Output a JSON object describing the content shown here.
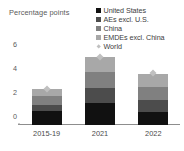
{
  "chart_data": {
    "type": "bar",
    "title": "",
    "subtitle": "",
    "xlabel": "",
    "ylabel": "Percentage points",
    "ylim": [
      0,
      6.6
    ],
    "yticks": [
      0,
      2,
      4,
      6
    ],
    "ytick_labels": [
      "0",
      "2",
      "4",
      "6"
    ],
    "grid": false,
    "stacked": true,
    "legend_position": "top-right",
    "categories": [
      "2015-19",
      "2021",
      "2022"
    ],
    "series": [
      {
        "name": "United States",
        "color": "#111111",
        "marker": "square",
        "values": [
          1.2,
          1.8,
          1.1
        ]
      },
      {
        "name": "AEs excl. U.S.",
        "color": "#4c4c4c",
        "marker": "square",
        "values": [
          0.5,
          1.3,
          1.0
        ]
      },
      {
        "name": "China",
        "color": "#808080",
        "marker": "square",
        "values": [
          0.7,
          1.3,
          1.1
        ]
      },
      {
        "name": "EMDEs excl. China",
        "color": "#a8a8a8",
        "marker": "square",
        "values": [
          0.6,
          1.3,
          1.1
        ]
      },
      {
        "name": "World",
        "color": "#c0c0c0",
        "marker": "diamond",
        "values": [
          3.0,
          5.7,
          4.3
        ]
      }
    ],
    "totals": [
      3.0,
      5.7,
      4.3
    ],
    "annotations": []
  },
  "axis_title": "Percentage\npoints",
  "legend": {
    "items": [
      {
        "label": "United States"
      },
      {
        "label": "AEs excl. U.S."
      },
      {
        "label": "China"
      },
      {
        "label": "EMDEs excl. China"
      },
      {
        "label": "World"
      }
    ]
  }
}
